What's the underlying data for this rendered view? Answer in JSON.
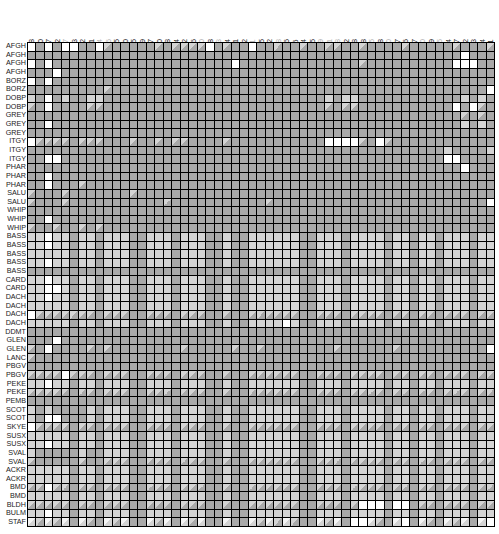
{
  "chart_data": {
    "type": "heatmap",
    "title": "",
    "legend": {
      "D": "dark gray",
      "L": "light gray",
      "W": "white",
      "H": "half light/dark (diagonal)",
      "h": "half white/light (diagonal)"
    },
    "columns": [
      {
        "label": "37561028",
        "dim": false
      },
      {
        "label": "37561820",
        "dim": false
      },
      {
        "label": "37563187",
        "dim": false
      },
      {
        "label": "37564422",
        "dim": false
      },
      {
        "label": "37565647",
        "dim": true
      },
      {
        "label": "37565783",
        "dim": false
      },
      {
        "label": "37566512",
        "dim": false
      },
      {
        "label": "37566991",
        "dim": false
      },
      {
        "label": "37567644",
        "dim": true
      },
      {
        "label": "37568606",
        "dim": true
      },
      {
        "label": "37568625",
        "dim": false
      },
      {
        "label": "37569180",
        "dim": false
      },
      {
        "label": "37569305",
        "dim": false
      },
      {
        "label": "37569349",
        "dim": false
      },
      {
        "label": "37569947",
        "dim": false
      },
      {
        "label": "37570040",
        "dim": false
      },
      {
        "label": "37570308",
        "dim": false
      },
      {
        "label": "37570324",
        "dim": false
      },
      {
        "label": "37570342",
        "dim": false
      },
      {
        "label": "37570346",
        "dim": false
      },
      {
        "label": "37570360",
        "dim": true
      },
      {
        "label": "37570668",
        "dim": false
      },
      {
        "label": "37570833",
        "dim": true
      },
      {
        "label": "37574004",
        "dim": false
      },
      {
        "label": "37574041",
        "dim": false
      },
      {
        "label": "37574392",
        "dim": false
      },
      {
        "label": "37574511",
        "dim": true
      },
      {
        "label": "37574975",
        "dim": false
      },
      {
        "label": "37575322",
        "dim": false
      },
      {
        "label": "37575498",
        "dim": true
      },
      {
        "label": "37576006",
        "dim": false
      },
      {
        "label": "37576116",
        "dim": false
      },
      {
        "label": "37576234",
        "dim": false
      },
      {
        "label": "37576255",
        "dim": false
      },
      {
        "label": "37577209",
        "dim": true
      },
      {
        "label": "37577531",
        "dim": true
      },
      {
        "label": "37579188",
        "dim": true
      },
      {
        "label": "37579622",
        "dim": false
      },
      {
        "label": "37579948",
        "dim": false
      },
      {
        "label": "37579978",
        "dim": false
      },
      {
        "label": "37580035",
        "dim": true
      },
      {
        "label": "37580048",
        "dim": false
      },
      {
        "label": "37580340",
        "dim": true
      },
      {
        "label": "37580467",
        "dim": false
      },
      {
        "label": "37580496",
        "dim": false
      },
      {
        "label": "37580507",
        "dim": false
      },
      {
        "label": "37580620",
        "dim": true
      },
      {
        "label": "37581019",
        "dim": false
      },
      {
        "label": "37581015",
        "dim": true
      },
      {
        "label": "37581854",
        "dim": false
      },
      {
        "label": "37582007",
        "dim": false
      },
      {
        "label": "37582812",
        "dim": false
      },
      {
        "label": "37583013",
        "dim": false
      },
      {
        "label": "37583074",
        "dim": false
      },
      {
        "label": "37585611",
        "dim": false
      }
    ],
    "rows": [
      {
        "label": "AFGH",
        "cells": "WDWDWWDDWHDDDDDHDHHHHWDHDDWDDHDDHDDHHDDHDDDDHDDDDDHDDDH"
      },
      {
        "label": "AFGH",
        "cells": "DDDDDDDDDDDDDDDDDDDDDDDDDDDDDDDDDDDDDDDDDDDDDDDDDDDWDDD"
      },
      {
        "label": "AFGH",
        "cells": "WDWDDDDDDDDDDDDDDDDDDDDDWDDDDDDDDDDDDDDHDDDDDDDDDDWWWDD"
      },
      {
        "label": "AFGH",
        "cells": "DDDWDDDDDDDDDDDDDDDDDDDDDDDDDDDDDDDDDDDDDDDDDDDDDDDDDDD"
      },
      {
        "label": "BORZ",
        "cells": "WDWDDDDDDDDDDDDDDDDDDDDDDDDDDDDDDDDDDDDDDDDDDDDDDDDDDDD"
      },
      {
        "label": "BORZ",
        "cells": "DDDDDDDDDHDDDDDDDDDDDDDDDDDDDDDDDDDDDDDDDDDDDDDDDDDDDDW"
      },
      {
        "label": "DOBP",
        "cells": "LDWDLDDLLDDDDDDDDDDDDDDDDDDDDDDDDDDLDLLDDDDDDDDDDDDLDLD"
      },
      {
        "label": "DOBP",
        "cells": "HDWDDDDHHDDDDDDDDDDDDDDDDDDDDDDDDDDHDHHDDDDDDDDDDDWDWHD"
      },
      {
        "label": "GREY",
        "cells": "DDDDDDDDDDDDDDDDDDDDDDDDDDDDDDDDDDDDDDDDDDDDDDDDDDDHDHD"
      },
      {
        "label": "GREY",
        "cells": "DDWDDDDDDDDDDDDDDDDDDDDDDDDDDDDDDDDDDDDDDDDDDDDDDDDLDLD"
      },
      {
        "label": "GREY",
        "cells": "DDDDDDDDDDDDDDDDDDDDDDDDDDDDDDDDDDDDDDDDDDDDDDDDDDDDDDD"
      },
      {
        "label": "ITGY",
        "cells": "WHHHHDHHHDDDHDDHDHHDDDDHDDDDDDDDDDDWWWWHDWHDDDDDDDDDDDD"
      },
      {
        "label": "ITGY",
        "cells": "DDDDDDDDDDDDDDDDDDDDDDDDDDDDDDDDDDDDDDDDDDDDDDDDDLDDDDL"
      },
      {
        "label": "ITGY",
        "cells": "DDWWDDDDDDDDDDDDDDDDDDDDDDDDDDDDDDDDDDDDDDDDDDDDDWWDDDD"
      },
      {
        "label": "PHAR",
        "cells": "DDDDDDDDDDDDDDDDDDDDDDDDDDDDDDDDDDDDDDDDDDDDDDDDDDDWDDD"
      },
      {
        "label": "PHAR",
        "cells": "DDWDDDDDDDDDDDDDDDDDDDDDDDDDDDDDDDDDDDDDDDDDDDDDDDDDDDD"
      },
      {
        "label": "PHAR",
        "cells": "DDWDDDHDDDDDDDDDDDDDDDDDDDDDDDDDDDDDDDDDDDDDDDDDDDDDDDD"
      },
      {
        "label": "SALU",
        "cells": "HDDDHDDDDDDDHDDDDDDDDDDDDDDDDDDDDDDDDDDDDDDDDDDDDDDDDDD"
      },
      {
        "label": "SALU",
        "cells": "HDDDHDDDDDDDDDDDHDDDDDDDDDDDHDDDDDDDDDDDDDDDDDDDDDDDDDW"
      },
      {
        "label": "WHIP",
        "cells": "DDDDDDDDDDDDDDDDDDDDDDDDDDDDDDDDDDDDDDDDDDDDDDDDDDDDDDD"
      },
      {
        "label": "WHIP",
        "cells": "DDWDDDDDDDDDDDDDDDDDDDDDDDDDDDDDDDDDDDDDDDDDDDDDDDDDDDD"
      },
      {
        "label": "WHIP",
        "cells": "HDDHDDHDHDDDDDDDDDDDDDDDDDDDDDDDDDDDDDDDDDDDDDDDDDDDDDD"
      },
      {
        "label": "BASS",
        "cells": "LLWLLDLLDLLLDDLLLDLLLDDLDDLLLLLLDDLLLDLLLLDLLDLLDLLLDLL"
      },
      {
        "label": "BASS",
        "cells": "LLWLLDLLDLLLDDLLLDLLLDDLDDLLLLLLDDLLLDLLLLDLLDLLDLLLDLL"
      },
      {
        "label": "BASS",
        "cells": "LLLLLDLLDLLLDDLLLDLLLDDLDDLLLLLLDDLLLDLLLLDLLDLLDLLLDLL"
      },
      {
        "label": "BASS",
        "cells": "LLWLLDLLDLLLDDLLLDLLLDDLDDLLLLLLDDLLLDLLLLDLLDLLDLLLDLL"
      },
      {
        "label": "BASS",
        "cells": "DDDDDDDDDDDDDDDDDDDDDDDDDDDDDDDDDDDDDDDDDDDDDDDDDDDDDDD"
      },
      {
        "label": "CARD",
        "cells": "LLWLLDLLDLLLDDLLLDLLLDDLDDLLLLLLDDLLLDLLLLDLLDLLDLLLDLL"
      },
      {
        "label": "CARD",
        "cells": "LLWWLDLLDLLLDDLLLDLLLDDLDDLLLLLLDDLLLDLLLLDLLDLLDLLLDLL"
      },
      {
        "label": "DACH",
        "cells": "LLWLLDLLDLLLDDLLLDLLLDDLDDLLLLLLDDLLLDLLLLDLLDLLDLLLDLL"
      },
      {
        "label": "DACH",
        "cells": "LLLLLDLLDLLLDDLLLDLLLDDLDDLLLLLLDDLLLDLLLLDLLDLLDLLLDLL"
      },
      {
        "label": "DACH",
        "cells": "WHHHHHHHDHHHDDHHHDHHHDDHDDHHHHHHDDHHHDHHHHDHHDHHDHHHDHH"
      },
      {
        "label": "DACH",
        "cells": "LLLLLDLLDLLLDDLLLDLLLDDLDDLLLLWLDDLLLDLLLLDLLDLLDLLLDLL"
      },
      {
        "label": "DDMT",
        "cells": "DDDDDDDDDDDDDDDDDDDDDDDDDDDDDDDDDDDDDDDDDDDDDDDDDDDDDDD"
      },
      {
        "label": "GLEN",
        "cells": "DDDWDDDDDDDDDDDDDDDDDDDDDDDDDDDDDDDDDDDDDDDDDDDDDDDDDDD"
      },
      {
        "label": "GLEN",
        "cells": "HDWDDDDHDHDDDDDDDDHDDDDDHDDHDDDDDDDDHDDDDDDHDDDDDDDDDDW"
      },
      {
        "label": "LANC",
        "cells": "HDDDDDDDDDDDDDDDDDDDDDDDDDDDDDDDDDDDDDDDDDDDDDDDDDDDDDD"
      },
      {
        "label": "PBGV",
        "cells": "DDDDDDDDDDDDDDDDDDDDDDDDDDDDDDDDDDDDDDDDDDDDDDDDDDDDDDD"
      },
      {
        "label": "PBGV",
        "cells": "HHHHWHHHDHHHDDHHHDHHHDDHDDHHHHHHDDHHHDHHHHDHHDHHDHHHDHH"
      },
      {
        "label": "PEKE",
        "cells": "LLWLLDLLDLLLDDLLLDLLLDDLDDLLLLLLDDLLLDLLLLDLLDLLDLLLDLL"
      },
      {
        "label": "PEKE",
        "cells": "HHHHHDHHDHHHDDHHHDHHHDDHDDHHHHHHDDHHHDHHHHDHHDHHDHHHDHH"
      },
      {
        "label": "PEMB",
        "cells": "DDDDDDDDDDDDDDDDDDDDDDDDDDDDDDDDDDDDDDDDDDDDDDDDDDDDDDD"
      },
      {
        "label": "SCOT",
        "cells": "LDLDDDDLDLLLDDLLLDLLLDDLDDLLLLLLDDLLLDLLLLDLLDLLDLLLDLL"
      },
      {
        "label": "SCOT",
        "cells": "LDWWDDDLDLLLDDLLLDLLLDDLDDLLLLLLDDLLLDLLLLDLLDLLDLLLDLL"
      },
      {
        "label": "SKYE",
        "cells": "WHHHHDHHDHHHDDHHHDHHHDDHDDHHHHHHDDHHHDHHHHDHHDHHDHHHDHH"
      },
      {
        "label": "SUSX",
        "cells": "LLLLLDLLDLLLDDLLLDLLLDDLDDLLLLLLDDLLLDLLLLDLLDLLDLLLDLL"
      },
      {
        "label": "SUSX",
        "cells": "LLWLLDLLDLLLDDLLLDLLLDDLDDLLLLLLDDLLLDLLLLDLLDLLDLLLDLL"
      },
      {
        "label": "SVAL",
        "cells": "LDDDDDLDDLLLDDLLLDLLLDDLDDLLLLLLDDLLLDLLLLDLLDLLDLLLDLL"
      },
      {
        "label": "SVAL",
        "cells": "HDDDDDHDDHHHDDHHHDHHHDDHDDHHHHHHDDHHHDHHHHDHHDHHDHHHDHH"
      },
      {
        "label": "ACKR",
        "cells": "LLLLLDLLDLLLDDLLLDLLLDDLDDLLLLLLDDLLLDLLLLDLLDLLDLLLDLL"
      },
      {
        "label": "ACKR",
        "cells": "LLLLLDLLDLLLDDLLLDLLLDDLDDLLLLLLDDLLLDLLLLDLLDLLDLLLDLL"
      },
      {
        "label": "BMD",
        "cells": "HHWHHDHHDHHHDDHHHDHHHDDHDDHHHHHHDDHHHDHHHHDHHDHHDHHHDHH"
      },
      {
        "label": "BMD",
        "cells": "LLLLLDLLDLLLDDLLLDLLLDDLDDLLLLLLDDLLLDLLLLDLLDLLDLLLDLL"
      },
      {
        "label": "BLDH",
        "cells": "HHHHHDHHDHHHDDHHHDHHHDDHDDHHHHHHDDHHHDHWWWDWWDHHDHHHDHH"
      },
      {
        "label": "BULM",
        "cells": "LLWLLDLLDLLLDDLLLDLLLDDLDDLLLLLLDDLLLDLLLLDLLDLLDLLLDLL"
      },
      {
        "label": "STAF",
        "cells": "hHhHhDhHDhHhDDhHhDhHhDDhDDhHhHhHDDhHhDWWhHDhWDhHDhHhDhW"
      }
    ]
  }
}
